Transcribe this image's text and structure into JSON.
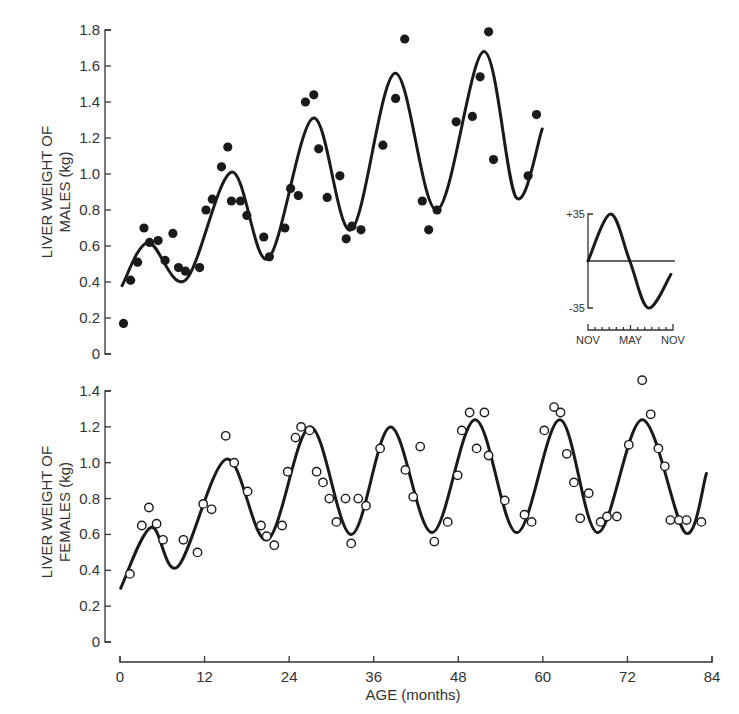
{
  "chart_data": [
    {
      "id": "males",
      "type": "scatter",
      "ylabel_line1": "LIVER WEIGHT OF",
      "ylabel_line2": "MALES (kg)",
      "xlabel": "",
      "xlim": [
        0,
        84
      ],
      "ylim": [
        0,
        1.8
      ],
      "yticks": [
        0,
        0.2,
        0.4,
        0.6,
        0.8,
        1.0,
        1.2,
        1.4,
        1.6,
        1.8
      ],
      "ytick_labels": [
        "0",
        "0.2",
        "0.4",
        "0.6",
        "0.8",
        "1.0",
        "1.2",
        "1.4",
        "1.6",
        "1.8"
      ],
      "marker": "filled-circle",
      "points": [
        [
          0.5,
          0.17
        ],
        [
          1.5,
          0.41
        ],
        [
          2.5,
          0.51
        ],
        [
          3.4,
          0.7
        ],
        [
          4.2,
          0.62
        ],
        [
          5.4,
          0.63
        ],
        [
          6.4,
          0.52
        ],
        [
          7.5,
          0.67
        ],
        [
          8.3,
          0.48
        ],
        [
          9.3,
          0.46
        ],
        [
          11.3,
          0.48
        ],
        [
          12.2,
          0.8
        ],
        [
          13.1,
          0.86
        ],
        [
          14.4,
          1.04
        ],
        [
          15.3,
          1.15
        ],
        [
          15.8,
          0.85
        ],
        [
          17.1,
          0.85
        ],
        [
          18.0,
          0.77
        ],
        [
          20.4,
          0.65
        ],
        [
          21.2,
          0.54
        ],
        [
          23.4,
          0.7
        ],
        [
          24.2,
          0.92
        ],
        [
          25.3,
          0.88
        ],
        [
          26.3,
          1.4
        ],
        [
          27.5,
          1.44
        ],
        [
          28.2,
          1.14
        ],
        [
          29.4,
          0.87
        ],
        [
          31.2,
          0.99
        ],
        [
          32.1,
          0.64
        ],
        [
          32.9,
          0.71
        ],
        [
          34.2,
          0.69
        ],
        [
          37.3,
          1.16
        ],
        [
          39.1,
          1.42
        ],
        [
          40.4,
          1.75
        ],
        [
          42.9,
          0.85
        ],
        [
          43.8,
          0.69
        ],
        [
          45.0,
          0.8
        ],
        [
          47.7,
          1.29
        ],
        [
          50.0,
          1.32
        ],
        [
          51.1,
          1.54
        ],
        [
          52.3,
          1.79
        ],
        [
          53.0,
          1.08
        ],
        [
          57.9,
          0.99
        ],
        [
          59.1,
          1.33
        ]
      ],
      "fit_curve_knots": [
        [
          0.3,
          0.38
        ],
        [
          4.0,
          0.62
        ],
        [
          9.3,
          0.41
        ],
        [
          15.8,
          1.01
        ],
        [
          21.0,
          0.53
        ],
        [
          27.4,
          1.31
        ],
        [
          32.8,
          0.69
        ],
        [
          39.0,
          1.56
        ],
        [
          45.0,
          0.8
        ],
        [
          51.6,
          1.68
        ],
        [
          56.2,
          0.87
        ],
        [
          59.9,
          1.25
        ]
      ]
    },
    {
      "id": "females",
      "type": "scatter",
      "ylabel_line1": "LIVER WEIGHT OF",
      "ylabel_line2": "FEMALES (kg)",
      "xlabel": "AGE (months)",
      "xlim": [
        0,
        84
      ],
      "ylim": [
        0,
        1.4
      ],
      "xticks": [
        0,
        12,
        24,
        36,
        48,
        60,
        72,
        84
      ],
      "xtick_labels": [
        "0",
        "12",
        "24",
        "36",
        "48",
        "60",
        "72",
        "84"
      ],
      "yticks": [
        0,
        0.2,
        0.4,
        0.6,
        0.8,
        1.0,
        1.2,
        1.4
      ],
      "ytick_labels": [
        "0",
        "0.2",
        "0.4",
        "0.6",
        "0.8",
        "1.0",
        "1.2",
        "1.4"
      ],
      "marker": "open-circle",
      "points": [
        [
          1.4,
          0.38
        ],
        [
          3.1,
          0.65
        ],
        [
          4.1,
          0.75
        ],
        [
          5.2,
          0.66
        ],
        [
          6.1,
          0.57
        ],
        [
          9.0,
          0.57
        ],
        [
          11.0,
          0.5
        ],
        [
          11.8,
          0.77
        ],
        [
          13.0,
          0.74
        ],
        [
          15.0,
          1.15
        ],
        [
          16.2,
          1.0
        ],
        [
          18.1,
          0.84
        ],
        [
          20.0,
          0.65
        ],
        [
          20.8,
          0.59
        ],
        [
          21.9,
          0.54
        ],
        [
          23.0,
          0.65
        ],
        [
          23.8,
          0.95
        ],
        [
          24.9,
          1.14
        ],
        [
          25.7,
          1.2
        ],
        [
          26.9,
          1.18
        ],
        [
          27.9,
          0.95
        ],
        [
          28.8,
          0.89
        ],
        [
          29.7,
          0.8
        ],
        [
          30.7,
          0.67
        ],
        [
          32.0,
          0.8
        ],
        [
          32.8,
          0.55
        ],
        [
          33.8,
          0.8
        ],
        [
          34.9,
          0.76
        ],
        [
          36.9,
          1.08
        ],
        [
          40.5,
          0.96
        ],
        [
          41.6,
          0.81
        ],
        [
          42.6,
          1.09
        ],
        [
          44.6,
          0.56
        ],
        [
          46.5,
          0.67
        ],
        [
          47.9,
          0.93
        ],
        [
          48.5,
          1.18
        ],
        [
          49.6,
          1.28
        ],
        [
          50.6,
          1.08
        ],
        [
          51.7,
          1.28
        ],
        [
          52.3,
          1.04
        ],
        [
          54.6,
          0.79
        ],
        [
          57.4,
          0.71
        ],
        [
          58.4,
          0.67
        ],
        [
          60.2,
          1.18
        ],
        [
          61.6,
          1.31
        ],
        [
          62.5,
          1.28
        ],
        [
          63.4,
          1.05
        ],
        [
          64.4,
          0.89
        ],
        [
          65.3,
          0.69
        ],
        [
          66.5,
          0.83
        ],
        [
          68.2,
          0.67
        ],
        [
          69.1,
          0.7
        ],
        [
          70.5,
          0.7
        ],
        [
          72.2,
          1.1
        ],
        [
          74.1,
          1.46
        ],
        [
          75.3,
          1.27
        ],
        [
          76.4,
          1.08
        ],
        [
          77.3,
          0.98
        ],
        [
          78.1,
          0.68
        ],
        [
          79.3,
          0.68
        ],
        [
          80.4,
          0.68
        ],
        [
          82.5,
          0.67
        ]
      ],
      "fit_curve_knots": [
        [
          0.1,
          0.3
        ],
        [
          4.4,
          0.64
        ],
        [
          8.2,
          0.42
        ],
        [
          15.1,
          1.02
        ],
        [
          20.9,
          0.57
        ],
        [
          27.0,
          1.2
        ],
        [
          32.8,
          0.6
        ],
        [
          38.4,
          1.2
        ],
        [
          44.3,
          0.61
        ],
        [
          50.4,
          1.24
        ],
        [
          56.3,
          0.61
        ],
        [
          62.4,
          1.24
        ],
        [
          67.8,
          0.61
        ],
        [
          74.1,
          1.24
        ],
        [
          80.2,
          0.61
        ],
        [
          83.2,
          0.94
        ]
      ]
    },
    {
      "id": "inset",
      "type": "line",
      "ylim": [
        -35,
        35
      ],
      "yticks": [
        35,
        -35
      ],
      "ytick_labels": [
        "+35",
        "-35"
      ],
      "xlim": [
        0,
        12
      ],
      "xtick_labels": [
        "NOV",
        "MAY",
        "NOV"
      ],
      "xtick_label_positions": [
        0,
        6,
        12
      ],
      "minor_ticks": 12,
      "zero_line": true,
      "curve_knots": [
        [
          0,
          0
        ],
        [
          3.2,
          35
        ],
        [
          5.9,
          0
        ],
        [
          8.5,
          -35
        ],
        [
          11.7,
          -10
        ]
      ]
    }
  ]
}
